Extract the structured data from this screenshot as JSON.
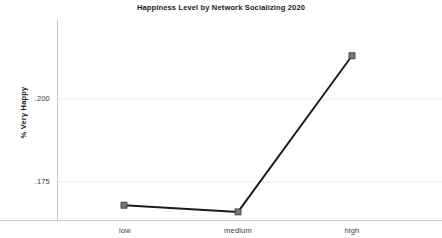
{
  "chart_data": {
    "type": "line",
    "title": "Happiness Level by Network Socializing 2020",
    "xlabel": "",
    "ylabel": "% Very Happy",
    "categories": [
      "low",
      "medium",
      "high"
    ],
    "values": [
      0.168,
      0.166,
      0.213
    ],
    "series": [
      {
        "name": "% Very Happy",
        "values": [
          0.168,
          0.166,
          0.213
        ]
      }
    ],
    "ytick_labels": [
      ".200",
      ".175"
    ],
    "ytick_values": [
      0.2,
      0.175
    ],
    "xtick_labels": [
      "low",
      "medium",
      "high"
    ],
    "ylim": [
      0.1595,
      0.2245
    ],
    "grid": true,
    "grid_axis": "y",
    "legend": false,
    "legend_position": "none",
    "line_color": "#1a1a1a",
    "marker": "square",
    "marker_color": "#555555",
    "background_color": "#ffffff",
    "axis_color": "#c8c8d0",
    "grid_color": "#eeeef2"
  },
  "axes": {
    "y_label": "% Very Happy",
    "y_ticks": [
      {
        "label": ".200",
        "value": 0.2
      },
      {
        "label": ".175",
        "value": 0.175
      }
    ],
    "x_ticks": [
      {
        "label": "low",
        "value": 0.168
      },
      {
        "label": "medium",
        "value": 0.166
      },
      {
        "label": "high",
        "value": 0.213
      }
    ]
  },
  "header": {
    "title": "Happiness Level by Network Socializing 2020"
  }
}
